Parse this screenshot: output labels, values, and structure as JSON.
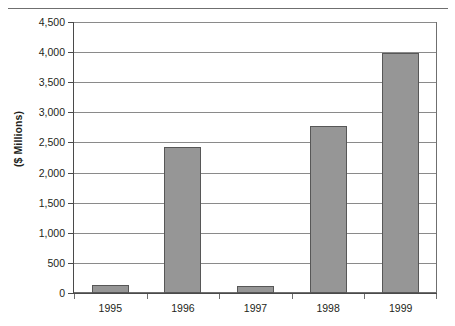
{
  "chart_data": {
    "type": "bar",
    "title": "",
    "xlabel": "",
    "ylabel": "($ Millions)",
    "categories": [
      "1995",
      "1996",
      "1997",
      "1998",
      "1999"
    ],
    "values": [
      135,
      2420,
      115,
      2770,
      3990
    ],
    "ylim": [
      0,
      4500
    ],
    "ytick_step": 500,
    "ytick_labels": [
      "4,500",
      "4,000",
      "3,500",
      "3,000",
      "2,500",
      "2,000",
      "1,500",
      "1,000",
      "500",
      "0"
    ],
    "ytick_values": [
      4500,
      4000,
      3500,
      3000,
      2500,
      2000,
      1500,
      1000,
      500,
      0
    ],
    "grid": "horizontal",
    "legend": "none",
    "series": [
      {
        "name": "",
        "values": [
          135,
          2420,
          115,
          2770,
          3990
        ]
      }
    ],
    "colors": {
      "bar_fill": "#969696",
      "bar_border": "#575757",
      "gridline": "#8a8a8a",
      "axis": "#4a4a4a",
      "plot_border": "#6f6f6f",
      "text": "#231f20",
      "background": "#ffffff"
    }
  }
}
